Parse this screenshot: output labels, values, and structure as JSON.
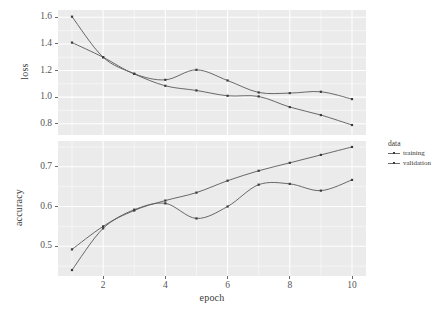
{
  "chart_data": {
    "type": "line",
    "title": "",
    "xlabel": "epoch",
    "x": [
      1,
      2,
      3,
      4,
      5,
      6,
      7,
      8,
      9,
      10
    ],
    "xlim": [
      0.55,
      10.45
    ],
    "xticks": [
      2,
      4,
      6,
      8,
      10
    ],
    "xticklabels": [
      "2",
      "4",
      "6",
      "8",
      "10"
    ],
    "grid": true,
    "legend": {
      "title": "data",
      "position": "right",
      "entries": [
        {
          "label": "training",
          "color": "#595959",
          "marker": "point-line"
        },
        {
          "label": "validation",
          "color": "#595959",
          "marker": "point-line"
        }
      ]
    },
    "facets": [
      {
        "name": "loss",
        "ylabel": "loss",
        "ylim": [
          0.715,
          1.655
        ],
        "yticks": [
          0.8,
          1.0,
          1.2,
          1.4,
          1.6
        ],
        "yticklabels": [
          "0.8",
          "1.0",
          "1.2",
          "1.4",
          "1.6"
        ],
        "series": [
          {
            "name": "training",
            "values": [
              1.605,
              1.3,
              1.175,
              1.085,
              1.05,
              1.01,
              1.005,
              0.925,
              0.865,
              0.79
            ]
          },
          {
            "name": "validation",
            "values": [
              1.41,
              1.3,
              1.175,
              1.13,
              1.205,
              1.125,
              1.035,
              1.03,
              1.04,
              0.985
            ]
          }
        ]
      },
      {
        "name": "accuracy",
        "ylabel": "accuracy",
        "ylim": [
          0.425,
          0.765
        ],
        "yticks": [
          0.5,
          0.6,
          0.7
        ],
        "yticklabels": [
          "0.5",
          "0.6",
          "0.7"
        ],
        "series": [
          {
            "name": "training",
            "values": [
              0.44,
              0.545,
              0.59,
              0.615,
              0.635,
              0.665,
              0.69,
              0.71,
              0.73,
              0.75
            ]
          },
          {
            "name": "validation",
            "values": [
              0.492,
              0.55,
              0.592,
              0.608,
              0.57,
              0.6,
              0.655,
              0.657,
              0.64,
              0.667
            ]
          }
        ]
      }
    ]
  }
}
